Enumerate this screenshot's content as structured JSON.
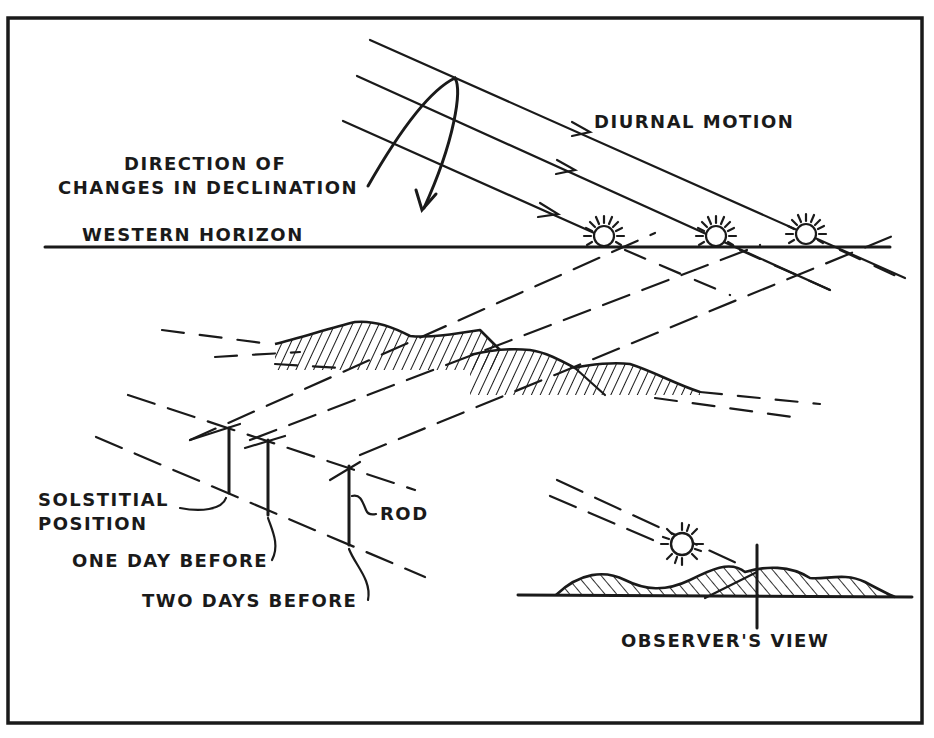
{
  "diagram": {
    "type": "astronomical-illustration",
    "colors": {
      "ink": "#1a1a1a",
      "paper": "#ffffff"
    }
  },
  "labels": {
    "diurnal_motion": "DIURNAL MOTION",
    "direction_line1": "DIRECTION OF",
    "direction_line2": "CHANGES IN DECLINATION",
    "western_horizon": "WESTERN HORIZON",
    "solstitial_line1": "SOLSTITIAL",
    "solstitial_line2": "POSITION",
    "one_day_before": "ONE DAY BEFORE",
    "two_days_before": "TWO DAYS BEFORE",
    "rod": "ROD",
    "observers_view": "OBSERVER'S VIEW"
  },
  "elements": {
    "suns_on_horizon": 3,
    "diurnal_paths": 3,
    "rods": 3,
    "observer_view_sun": 1
  }
}
